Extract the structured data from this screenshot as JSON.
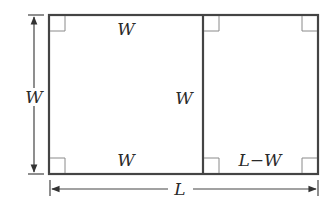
{
  "diagram": {
    "labels": {
      "square_top": "W",
      "square_bottom": "W",
      "divider": "W",
      "left_dimension": "W",
      "remainder_bottom": "L−W",
      "bottom_dimension": "L"
    },
    "right_angle_marks": 6,
    "colors": {
      "edge": "#444444",
      "right_angle_mark": "#8a8a8a",
      "text": "#2a2a2a"
    }
  }
}
